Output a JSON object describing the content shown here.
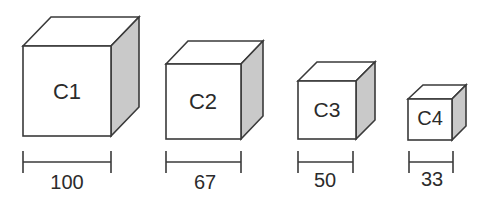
{
  "diagram": {
    "title": "",
    "colors": {
      "stroke": "#3a3a3a",
      "face": "#ffffff",
      "shaded_side": "#c9c9c9",
      "text": "#2b2b2b"
    },
    "cubes": [
      {
        "label": "C1",
        "dimension": "100"
      },
      {
        "label": "C2",
        "dimension": "67"
      },
      {
        "label": "C3",
        "dimension": "50"
      },
      {
        "label": "C4",
        "dimension": "33"
      }
    ]
  }
}
